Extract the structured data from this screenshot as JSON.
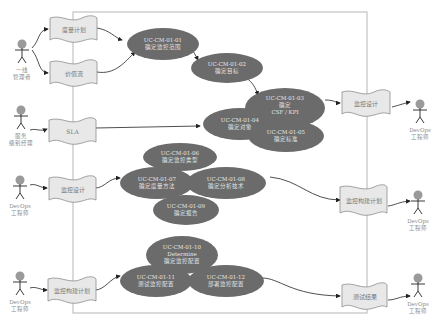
{
  "diagram": {
    "type": "use-case",
    "colors": {
      "usecase_fill": "#6b6b6b",
      "usecase_text": "#e6e6e6",
      "doc_fill": "#e8e8e8",
      "boundary": "#b5b5b5",
      "actor_head": "#9a9a9a",
      "arrow": "#222222"
    },
    "actors": [
      {
        "id": "a1",
        "label": "一线\n管理者"
      },
      {
        "id": "a2",
        "label": "服务\n级别经理"
      },
      {
        "id": "a3",
        "label": "DevOps\n工程师"
      },
      {
        "id": "a4",
        "label": "DevOps\n工程师"
      },
      {
        "id": "a5",
        "label": "DevOps\n工程师"
      },
      {
        "id": "a6",
        "label": "DevOps\n工程师"
      },
      {
        "id": "a7",
        "label": "DevOps\n工程师"
      }
    ],
    "documents": [
      {
        "id": "d1",
        "label": "度量计划"
      },
      {
        "id": "d2",
        "label": "价值流"
      },
      {
        "id": "d3",
        "label": "SLA"
      },
      {
        "id": "d4",
        "label": "监控设计"
      },
      {
        "id": "d5",
        "label": "监控设计"
      },
      {
        "id": "d6",
        "label": "监控构建计划"
      },
      {
        "id": "d7",
        "label": "监控构建计划"
      },
      {
        "id": "d8",
        "label": "测试结果"
      }
    ],
    "use_cases": [
      {
        "id": "uc01",
        "label": "UC-CM-01-01\n确定监控范围"
      },
      {
        "id": "uc02",
        "label": "UC-CM-01-02\n确定目标"
      },
      {
        "id": "uc03",
        "label": "UC-CM-01-03\n确定\nCSF / KPI"
      },
      {
        "id": "uc04",
        "label": "UC-CM-01-04\n确定对象"
      },
      {
        "id": "uc05",
        "label": "UC-CM-01-05\n确定标准"
      },
      {
        "id": "uc06",
        "label": "UC-CM-01-06\n确定监控类型"
      },
      {
        "id": "uc07",
        "label": "UC-CM-01-07\n确定度量方法"
      },
      {
        "id": "uc08",
        "label": "UC-CM-01-08\n确定分析技术"
      },
      {
        "id": "uc09",
        "label": "UC-CM-01-09\n确定报告"
      },
      {
        "id": "uc10",
        "label": "UC-CM-01-10\nDetermine\n确定监控配置"
      },
      {
        "id": "uc11",
        "label": "UC-CM-01-11\n测试监控配置"
      },
      {
        "id": "uc12",
        "label": "UC-CM-01-12\n部署监控配置"
      }
    ]
  }
}
